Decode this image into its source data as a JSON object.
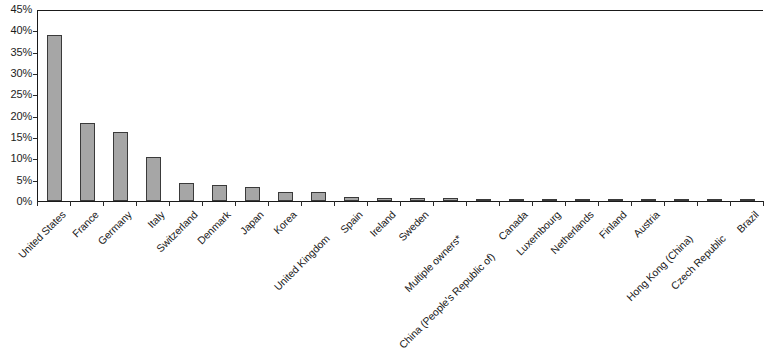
{
  "chart_data": {
    "type": "bar",
    "title": "",
    "subtitle": "",
    "xlabel": "",
    "ylabel": "",
    "ylim": [
      0,
      45
    ],
    "grid": false,
    "legend": null,
    "y_tick_labels": [
      "45%",
      "40%",
      "35%",
      "30%",
      "25%",
      "20%",
      "15%",
      "10%",
      "5%",
      "0%"
    ],
    "y_tick_values": [
      45,
      40,
      35,
      30,
      25,
      20,
      15,
      10,
      5,
      0
    ],
    "categories": [
      "United States",
      "France",
      "Germany",
      "Italy",
      "Switzerland",
      "Denmark",
      "Japan",
      "Korea",
      "United Kingdom",
      "Spain",
      "Ireland",
      "Sweden",
      "Multiple owners*",
      "China (People's Republic of)",
      "Canada",
      "Luxembourg",
      "Netherlands",
      "Finland",
      "Austria",
      "Hong Kong (China)",
      "Czech Republic",
      "Brazil"
    ],
    "values": [
      39.0,
      18.2,
      16.2,
      10.2,
      4.2,
      3.8,
      3.2,
      2.2,
      2.1,
      1.0,
      0.7,
      0.6,
      0.6,
      0.5,
      0.5,
      0.4,
      0.4,
      0.3,
      0.3,
      0.3,
      0.25,
      0.2
    ],
    "series": [
      {
        "name": "Share",
        "values": [
          39.0,
          18.2,
          16.2,
          10.2,
          4.2,
          3.8,
          3.2,
          2.2,
          2.1,
          1.0,
          0.7,
          0.6,
          0.6,
          0.5,
          0.5,
          0.4,
          0.4,
          0.3,
          0.3,
          0.3,
          0.25,
          0.2
        ]
      }
    ],
    "bar_color": "#a6a6a6",
    "bar_border_color": "#3a3a3a",
    "axis_color": "#1a1a1a",
    "background_color": "#ffffff"
  }
}
